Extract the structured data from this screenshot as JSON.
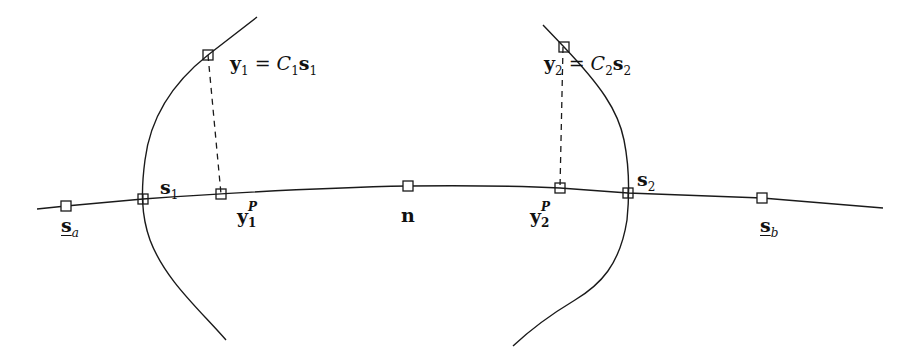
{
  "diagram": {
    "colors": {
      "stroke": "#1a1a1a",
      "background": "#ffffff",
      "marker_fill": "#ffffff"
    },
    "main_curve": {
      "label": "path through n",
      "points": [
        [
          37,
          209
        ],
        [
          66,
          206
        ],
        [
          143,
          199
        ],
        [
          221,
          194
        ],
        [
          408,
          186
        ],
        [
          560,
          188
        ],
        [
          628,
          193
        ],
        [
          762,
          198
        ],
        [
          883,
          208
        ]
      ]
    },
    "left_curve": {
      "points": [
        [
          257,
          17
        ],
        [
          208,
          55
        ],
        [
          150,
          130
        ],
        [
          143,
          199
        ],
        [
          150,
          240
        ],
        [
          226,
          340
        ]
      ]
    },
    "right_curve": {
      "points": [
        [
          543,
          25
        ],
        [
          563,
          47
        ],
        [
          620,
          120
        ],
        [
          628,
          193
        ],
        [
          615,
          260
        ],
        [
          513,
          346
        ]
      ]
    },
    "dashed_projections": [
      {
        "from": "y1",
        "to": "y1P",
        "line": [
          [
            208,
            55
          ],
          [
            221,
            194
          ]
        ]
      },
      {
        "from": "y2",
        "to": "y2P",
        "line": [
          [
            563,
            47
          ],
          [
            560,
            188
          ]
        ]
      }
    ],
    "markers": [
      {
        "id": "sa",
        "x": 66,
        "y": 206
      },
      {
        "id": "s1",
        "x": 143,
        "y": 199
      },
      {
        "id": "y1P",
        "x": 221,
        "y": 194
      },
      {
        "id": "n",
        "x": 408,
        "y": 186
      },
      {
        "id": "y2P",
        "x": 560,
        "y": 188
      },
      {
        "id": "s2",
        "x": 628,
        "y": 193
      },
      {
        "id": "sb",
        "x": 762,
        "y": 198
      },
      {
        "id": "y1",
        "x": 208,
        "y": 55
      },
      {
        "id": "y2",
        "x": 564,
        "y": 47
      }
    ],
    "labels": {
      "sa": {
        "base": "s",
        "sub": "a",
        "underline": true
      },
      "sb": {
        "base": "s",
        "sub": "b",
        "underline": true
      },
      "s1": {
        "base": "s",
        "sub": "1"
      },
      "s2": {
        "base": "s",
        "sub": "2"
      },
      "n": {
        "base": "n"
      },
      "y1P": {
        "base": "y",
        "sub": "1",
        "sup": "P"
      },
      "y2P": {
        "base": "y",
        "sub": "2",
        "sup": "P"
      },
      "eq1": {
        "lhs_base": "y",
        "lhs_sub": "1",
        "op": "=",
        "rhs_C": "C",
        "rhs_C_sub": "1",
        "rhs_s": "s",
        "rhs_s_sub": "1"
      },
      "eq2": {
        "lhs_base": "y",
        "lhs_sub": "2",
        "op": "=",
        "rhs_C": "C",
        "rhs_C_sub": "2",
        "rhs_s": "s",
        "rhs_s_sub": "2"
      }
    }
  }
}
